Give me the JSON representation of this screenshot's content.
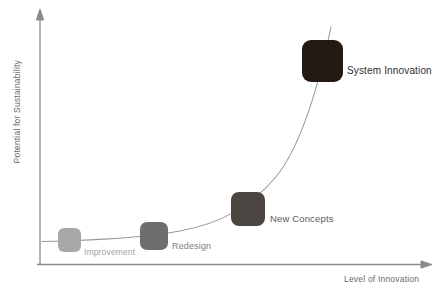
{
  "diagram": {
    "axes": {
      "y_label": "Potential for Sustainability",
      "x_label": "Level of Innovation",
      "axis_color": "#8a8a8a"
    },
    "curve": {
      "name": "exponential-trend-curve",
      "color": "#9a9a9a"
    },
    "nodes": [
      {
        "id": "improvement",
        "label": "Improvement",
        "box_color": "#a8a8a8",
        "label_color": "#a3a3a3",
        "label_size": "8.5px",
        "box": {
          "left": 58,
          "top": 228,
          "width": 23,
          "height": 24
        },
        "label_pos": {
          "left": 84,
          "top": 247
        }
      },
      {
        "id": "redesign",
        "label": "Redesign",
        "box_color": "#6e6e6e",
        "label_color": "#7d7d7d",
        "label_size": "9px",
        "box": {
          "left": 140,
          "top": 222,
          "width": 28,
          "height": 28
        },
        "label_pos": {
          "left": 172,
          "top": 241
        }
      },
      {
        "id": "new-concepts",
        "label": "New Concepts",
        "box_color": "#4a4540",
        "label_color": "#5c5c5c",
        "label_size": "9.5px",
        "box": {
          "left": 231,
          "top": 192,
          "width": 34,
          "height": 34
        },
        "label_pos": {
          "left": 270,
          "top": 213
        }
      },
      {
        "id": "system-innovation",
        "label": "System Innovation",
        "box_color": "#251a13",
        "label_color": "#2f2f2f",
        "label_size": "10px",
        "box": {
          "left": 302,
          "top": 40,
          "width": 41,
          "height": 42
        },
        "label_pos": {
          "left": 347,
          "top": 65
        }
      }
    ]
  }
}
